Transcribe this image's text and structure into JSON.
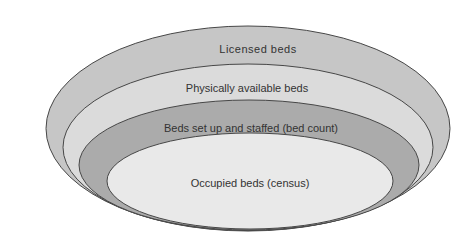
{
  "diagram": {
    "background_color": "#ffffff",
    "outline_color": "#474747",
    "label_color": "#333333",
    "layers": [
      {
        "label": "Licensed beds",
        "fill": "#c6c6c6"
      },
      {
        "label": "Physically available beds",
        "fill": "#dbdbdb"
      },
      {
        "label": "Beds set up and staffed (bed count)",
        "fill": "#ababab"
      },
      {
        "label": "Occupied beds (census)",
        "fill": "#e9e9e9"
      }
    ]
  }
}
